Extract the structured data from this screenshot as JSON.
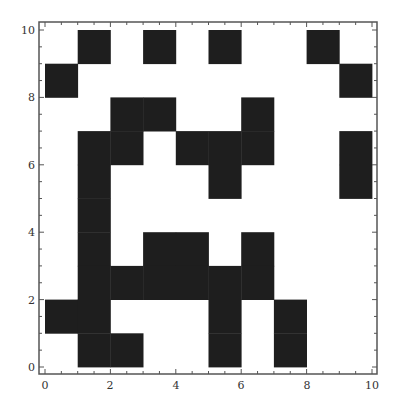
{
  "chart_data": {
    "type": "heatmap",
    "title": "",
    "xlabel": "",
    "ylabel": "",
    "xlim": [
      0,
      10
    ],
    "ylim": [
      0,
      10
    ],
    "grid": false,
    "legend": null,
    "x_ticks": [
      "0",
      "2",
      "4",
      "6",
      "8",
      "10"
    ],
    "y_ticks": [
      "0",
      "2",
      "4",
      "6",
      "8",
      "10"
    ],
    "cell_size": 1,
    "colors": {
      "filled": "#1e1e1e",
      "empty": "#ffffff",
      "frame": "#555555"
    },
    "filled_cells": [
      [
        1,
        9
      ],
      [
        3,
        9
      ],
      [
        5,
        9
      ],
      [
        8,
        9
      ],
      [
        0,
        8
      ],
      [
        9,
        8
      ],
      [
        2,
        7
      ],
      [
        3,
        7
      ],
      [
        6,
        7
      ],
      [
        1,
        6
      ],
      [
        2,
        6
      ],
      [
        4,
        6
      ],
      [
        5,
        6
      ],
      [
        6,
        6
      ],
      [
        9,
        6
      ],
      [
        1,
        5
      ],
      [
        5,
        5
      ],
      [
        9,
        5
      ],
      [
        1,
        4
      ],
      [
        1,
        3
      ],
      [
        3,
        3
      ],
      [
        4,
        3
      ],
      [
        6,
        3
      ],
      [
        1,
        2
      ],
      [
        2,
        2
      ],
      [
        3,
        2
      ],
      [
        4,
        2
      ],
      [
        5,
        2
      ],
      [
        6,
        2
      ],
      [
        0,
        1
      ],
      [
        1,
        1
      ],
      [
        5,
        1
      ],
      [
        7,
        1
      ],
      [
        1,
        0
      ],
      [
        2,
        0
      ],
      [
        5,
        0
      ],
      [
        7,
        0
      ]
    ],
    "rows_top_to_bottom": [
      "0101010010",
      "1000000001",
      "0011001000",
      "0110111001",
      "0100010001",
      "0100000000",
      "0101101000",
      "0111111000",
      "1100010100",
      "0110010100"
    ]
  }
}
